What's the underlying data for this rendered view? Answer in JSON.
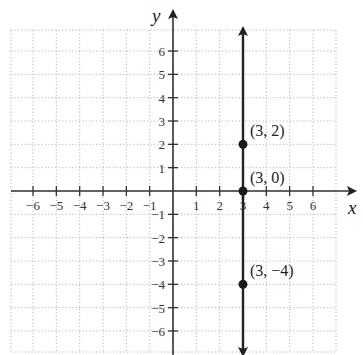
{
  "header_cutoff_text": "",
  "chart_data": {
    "type": "line",
    "title": "",
    "xlabel": "x",
    "ylabel": "y",
    "xlim": [
      -7,
      7
    ],
    "ylim": [
      -7,
      7
    ],
    "grid": true,
    "grid_style": "dotted",
    "x_ticks": [
      -6,
      -5,
      -4,
      -3,
      -2,
      -1,
      1,
      2,
      3,
      4,
      5,
      6
    ],
    "y_ticks": [
      -6,
      -5,
      -4,
      -3,
      -2,
      -1,
      1,
      2,
      3,
      4,
      5,
      6
    ],
    "x_tick_labels": [
      "−6",
      "−5",
      "−4",
      "−3",
      "−2",
      "−1",
      "1",
      "2",
      "3",
      "4",
      "5",
      "6"
    ],
    "y_tick_labels": [
      "−6",
      "−5",
      "−4",
      "−3",
      "−2",
      "−1",
      "1",
      "2",
      "3",
      "4",
      "5",
      "6"
    ],
    "series": [
      {
        "name": "x = 3",
        "kind": "vertical-line",
        "x": 3,
        "y_range": [
          -7,
          7
        ],
        "arrows": "both",
        "color": "#222222"
      }
    ],
    "points": [
      {
        "x": 3,
        "y": 2,
        "label": "(3, 2)"
      },
      {
        "x": 3,
        "y": 0,
        "label": "(3, 0)"
      },
      {
        "x": 3,
        "y": -4,
        "label": "(3, −4)"
      }
    ]
  },
  "colors": {
    "axis": "#333333",
    "grid": "#b5b5b5",
    "line": "#222222",
    "point": "#1a1a1a"
  }
}
